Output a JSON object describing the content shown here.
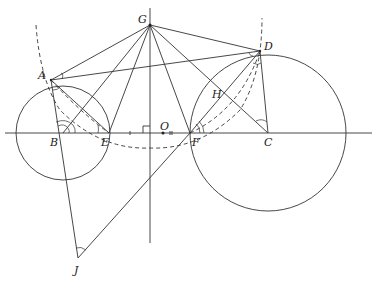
{
  "diagram": {
    "type": "geometry",
    "points": {
      "A": {
        "label": "A",
        "x": 51,
        "y": 80
      },
      "B": {
        "label": "B",
        "x": 63,
        "y": 133
      },
      "C": {
        "label": "C",
        "x": 268,
        "y": 133
      },
      "D": {
        "label": "D",
        "x": 260,
        "y": 51
      },
      "E": {
        "label": "E",
        "x": 109,
        "y": 133
      },
      "F": {
        "label": "F",
        "x": 190,
        "y": 133
      },
      "G": {
        "label": "G",
        "x": 150,
        "y": 25
      },
      "H": {
        "label": "H",
        "x": 224,
        "y": 93
      },
      "J": {
        "label": "J",
        "x": 78,
        "y": 258
      },
      "O": {
        "label": "O",
        "x": 163,
        "y": 133
      }
    },
    "circles": [
      {
        "name": "circle-B",
        "center": "B",
        "radius": 47
      },
      {
        "name": "circle-C",
        "center": "C",
        "radius": 78
      }
    ],
    "segments": [
      [
        "G",
        "A"
      ],
      [
        "G",
        "B"
      ],
      [
        "G",
        "E"
      ],
      [
        "G",
        "F"
      ],
      [
        "G",
        "C"
      ],
      [
        "G",
        "D"
      ],
      [
        "A",
        "D"
      ],
      [
        "A",
        "E"
      ],
      [
        "A",
        "J"
      ],
      [
        "J",
        "F"
      ],
      [
        "F",
        "D"
      ],
      [
        "D",
        "C"
      ]
    ],
    "dashed": [
      "arc-A-E-F-D",
      "segment-A-E-dashed",
      "segment-F-D-dashed"
    ],
    "marks": [
      "right-angle-at-axis",
      "equal-ticks-EO-OF"
    ]
  }
}
